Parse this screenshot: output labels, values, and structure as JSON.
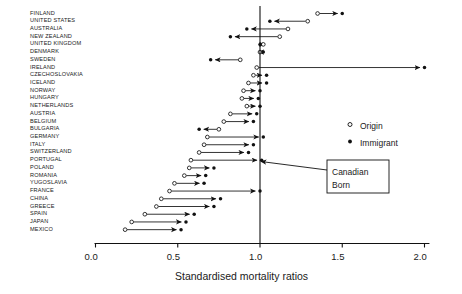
{
  "chart_data": {
    "type": "scatter",
    "title": "",
    "xlabel": "Standardised mortality ratios",
    "ylabel": "",
    "xlim": [
      0.0,
      2.05
    ],
    "xticks": [
      0.0,
      0.5,
      1.0,
      1.5,
      2.0
    ],
    "xticklabels": [
      "0.0",
      "0.5",
      "1.0",
      "1.5",
      "2.0"
    ],
    "grid": false,
    "reference_line": {
      "value": 1.0,
      "label": "Canadian Born"
    },
    "legend": {
      "position": "right-middle",
      "entries": [
        {
          "name": "Origin",
          "marker": "open-circle"
        },
        {
          "name": "Immigrant",
          "marker": "filled-circle"
        }
      ]
    },
    "series": [
      {
        "name": "Origin",
        "marker": "open-circle"
      },
      {
        "name": "Immigrant",
        "marker": "filled-circle"
      }
    ],
    "categories": [
      "FINLAND",
      "UNITED STATES",
      "AUSTRALIA",
      "NEW ZEALAND",
      "UNITED KINGDOM",
      "DENMARK",
      "SWEDEN",
      "IRELAND",
      "CZECHOSLOVAKIA",
      "ICELAND",
      "NORWAY",
      "HUNGARY",
      "NETHERLANDS",
      "AUSTRIA",
      "BELGIUM",
      "BULGARIA",
      "GERMANY",
      "ITALY",
      "SWITZERLAND",
      "PORTUGAL",
      "POLAND",
      "ROMANIA",
      "YUGOSLAVIA",
      "FRANCE",
      "CHINA",
      "GREECE",
      "SPAIN",
      "JAPAN",
      "MEXICO"
    ],
    "points": [
      {
        "country": "FINLAND",
        "origin": 1.35,
        "immigrant": 1.5
      },
      {
        "country": "UNITED STATES",
        "origin": 1.29,
        "immigrant": 1.06
      },
      {
        "country": "AUSTRALIA",
        "origin": 1.17,
        "immigrant": 0.92
      },
      {
        "country": "NEW ZEALAND",
        "origin": 1.12,
        "immigrant": 0.82
      },
      {
        "country": "UNITED KINGDOM",
        "origin": 1.02,
        "immigrant": 1.0
      },
      {
        "country": "DENMARK",
        "origin": 1.0,
        "immigrant": 1.02
      },
      {
        "country": "SWEDEN",
        "origin": 0.88,
        "immigrant": 0.7
      },
      {
        "country": "IRELAND",
        "origin": 0.98,
        "immigrant": 2.0
      },
      {
        "country": "CZECHOSLOVAKIA",
        "origin": 0.96,
        "immigrant": 1.04
      },
      {
        "country": "ICELAND",
        "origin": 0.93,
        "immigrant": 1.04
      },
      {
        "country": "NORWAY",
        "origin": 0.9,
        "immigrant": 1.0
      },
      {
        "country": "HUNGARY",
        "origin": 0.89,
        "immigrant": 0.99
      },
      {
        "country": "NETHERLANDS",
        "origin": 0.92,
        "immigrant": 1.0
      },
      {
        "country": "AUSTRIA",
        "origin": 0.82,
        "immigrant": 0.98
      },
      {
        "country": "BELGIUM",
        "origin": 0.78,
        "immigrant": 0.96
      },
      {
        "country": "BULGARIA",
        "origin": 0.75,
        "immigrant": 0.63
      },
      {
        "country": "GERMANY",
        "origin": 0.68,
        "immigrant": 1.02
      },
      {
        "country": "ITALY",
        "origin": 0.66,
        "immigrant": 0.96
      },
      {
        "country": "SWITZERLAND",
        "origin": 0.63,
        "immigrant": 0.93
      },
      {
        "country": "PORTUGAL",
        "origin": 0.58,
        "immigrant": 1.01
      },
      {
        "country": "POLAND",
        "origin": 0.57,
        "immigrant": 0.72
      },
      {
        "country": "ROMANIA",
        "origin": 0.54,
        "immigrant": 0.67
      },
      {
        "country": "YUGOSLAVIA",
        "origin": 0.48,
        "immigrant": 0.66
      },
      {
        "country": "FRANCE",
        "origin": 0.45,
        "immigrant": 1.0
      },
      {
        "country": "CHINA",
        "origin": 0.4,
        "immigrant": 0.76
      },
      {
        "country": "GREECE",
        "origin": 0.37,
        "immigrant": 0.72
      },
      {
        "country": "SPAIN",
        "origin": 0.3,
        "immigrant": 0.6
      },
      {
        "country": "JAPAN",
        "origin": 0.22,
        "immigrant": 0.55
      },
      {
        "country": "MEXICO",
        "origin": 0.18,
        "immigrant": 0.52
      }
    ]
  },
  "annotation": {
    "line1": "Canadian",
    "line2": "Born"
  }
}
